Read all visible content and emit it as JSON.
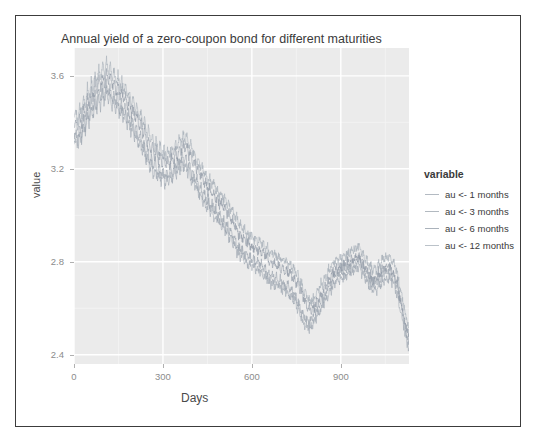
{
  "frame": {
    "border_color": "#3c3c3c",
    "background": "#ffffff"
  },
  "panel": {
    "background": "#ebebeb",
    "gridline_color": "#ffffff"
  },
  "chart_data": {
    "type": "line",
    "title": "Annual yield of a zero-coupon bond for different maturities",
    "xlabel": "Days",
    "ylabel": "value",
    "legend_title": "variable",
    "legend_position": "right",
    "grid": true,
    "xlim": [
      0,
      1130
    ],
    "ylim": [
      2.36,
      3.72
    ],
    "xticks": [
      0,
      300,
      600,
      900
    ],
    "yticks": [
      3.6,
      3.2,
      2.8,
      2.4
    ],
    "xtick_labels": [
      "0",
      "300",
      "600",
      "900"
    ],
    "ytick_labels": [
      "3.6",
      "3.2",
      "2.8",
      "2.4"
    ],
    "minor_xticks": [
      150,
      450,
      750,
      1050
    ],
    "minor_yticks": [
      3.4,
      3.0,
      2.6
    ],
    "series": [
      {
        "name": "au <- 1 months",
        "color": "#9aa3ad",
        "offset": -0.07,
        "values": [
          3.3,
          3.33,
          3.28,
          3.36,
          3.31,
          3.4,
          3.34,
          3.44,
          3.38,
          3.47,
          3.41,
          3.5,
          3.44,
          3.52,
          3.46,
          3.54,
          3.47,
          3.55,
          3.48,
          3.53,
          3.46,
          3.51,
          3.44,
          3.49,
          3.42,
          3.47,
          3.4,
          3.45,
          3.38,
          3.42,
          3.35,
          3.39,
          3.32,
          3.36,
          3.29,
          3.33,
          3.26,
          3.3,
          3.22,
          3.26,
          3.19,
          3.23,
          3.16,
          3.21,
          3.14,
          3.19,
          3.13,
          3.18,
          3.12,
          3.17,
          3.13,
          3.18,
          3.14,
          3.2,
          3.16,
          3.22,
          3.18,
          3.24,
          3.19,
          3.23,
          3.17,
          3.2,
          3.14,
          3.16,
          3.11,
          3.13,
          3.08,
          3.1,
          3.05,
          3.07,
          3.02,
          3.05,
          3.0,
          3.03,
          2.98,
          3.0,
          2.96,
          2.98,
          2.94,
          2.96,
          2.92,
          2.94,
          2.89,
          2.91,
          2.86,
          2.88,
          2.83,
          2.85,
          2.81,
          2.83,
          2.79,
          2.81,
          2.78,
          2.8,
          2.77,
          2.79,
          2.76,
          2.78,
          2.75,
          2.77,
          2.73,
          2.75,
          2.71,
          2.73,
          2.7,
          2.72,
          2.69,
          2.71,
          2.68,
          2.7,
          2.67,
          2.69,
          2.66,
          2.68,
          2.64,
          2.66,
          2.62,
          2.64,
          2.58,
          2.6,
          2.54,
          2.56,
          2.51,
          2.53,
          2.5,
          2.53,
          2.52,
          2.56,
          2.55,
          2.59,
          2.58,
          2.62,
          2.61,
          2.65,
          2.64,
          2.68,
          2.67,
          2.71,
          2.7,
          2.73,
          2.71,
          2.74,
          2.72,
          2.75,
          2.73,
          2.76,
          2.74,
          2.77,
          2.75,
          2.78,
          2.76,
          2.79,
          2.74,
          2.76,
          2.71,
          2.73,
          2.68,
          2.7,
          2.66,
          2.69,
          2.67,
          2.71,
          2.69,
          2.73,
          2.71,
          2.74,
          2.72,
          2.75,
          2.7,
          2.72,
          2.66,
          2.67,
          2.6,
          2.58,
          2.53,
          2.49,
          2.45,
          2.43
        ]
      },
      {
        "name": "au <- 3 months",
        "color": "#98a1ab",
        "offset": -0.02,
        "values": [
          3.33,
          3.36,
          3.31,
          3.39,
          3.34,
          3.43,
          3.37,
          3.47,
          3.41,
          3.5,
          3.44,
          3.53,
          3.47,
          3.55,
          3.49,
          3.57,
          3.5,
          3.58,
          3.51,
          3.56,
          3.49,
          3.54,
          3.47,
          3.52,
          3.45,
          3.5,
          3.43,
          3.48,
          3.41,
          3.45,
          3.38,
          3.42,
          3.35,
          3.39,
          3.32,
          3.36,
          3.29,
          3.33,
          3.25,
          3.29,
          3.22,
          3.26,
          3.19,
          3.24,
          3.17,
          3.22,
          3.16,
          3.21,
          3.15,
          3.2,
          3.16,
          3.21,
          3.17,
          3.23,
          3.19,
          3.25,
          3.21,
          3.27,
          3.22,
          3.26,
          3.2,
          3.23,
          3.17,
          3.19,
          3.14,
          3.16,
          3.11,
          3.13,
          3.08,
          3.1,
          3.05,
          3.08,
          3.03,
          3.06,
          3.01,
          3.03,
          2.99,
          3.01,
          2.97,
          2.99,
          2.95,
          2.97,
          2.92,
          2.94,
          2.89,
          2.91,
          2.86,
          2.88,
          2.84,
          2.86,
          2.82,
          2.84,
          2.81,
          2.83,
          2.8,
          2.82,
          2.79,
          2.81,
          2.78,
          2.8,
          2.76,
          2.78,
          2.74,
          2.76,
          2.73,
          2.75,
          2.72,
          2.74,
          2.71,
          2.73,
          2.7,
          2.72,
          2.69,
          2.71,
          2.67,
          2.69,
          2.65,
          2.67,
          2.61,
          2.63,
          2.57,
          2.59,
          2.54,
          2.56,
          2.53,
          2.56,
          2.55,
          2.59,
          2.58,
          2.62,
          2.61,
          2.65,
          2.64,
          2.68,
          2.67,
          2.71,
          2.7,
          2.74,
          2.73,
          2.76,
          2.74,
          2.77,
          2.75,
          2.78,
          2.76,
          2.79,
          2.77,
          2.8,
          2.78,
          2.81,
          2.79,
          2.82,
          2.77,
          2.79,
          2.74,
          2.76,
          2.71,
          2.73,
          2.69,
          2.72,
          2.7,
          2.74,
          2.72,
          2.76,
          2.74,
          2.77,
          2.75,
          2.78,
          2.73,
          2.75,
          2.69,
          2.7,
          2.63,
          2.61,
          2.56,
          2.52,
          2.48,
          2.46
        ]
      },
      {
        "name": "au <- 6 months",
        "color": "#8e98a4",
        "offset": 0.03,
        "values": [
          3.38,
          3.41,
          3.36,
          3.44,
          3.39,
          3.48,
          3.42,
          3.52,
          3.46,
          3.55,
          3.49,
          3.58,
          3.52,
          3.6,
          3.54,
          3.62,
          3.55,
          3.63,
          3.56,
          3.61,
          3.54,
          3.59,
          3.52,
          3.57,
          3.5,
          3.55,
          3.48,
          3.53,
          3.46,
          3.5,
          3.43,
          3.47,
          3.4,
          3.44,
          3.37,
          3.41,
          3.34,
          3.38,
          3.3,
          3.34,
          3.27,
          3.31,
          3.24,
          3.29,
          3.22,
          3.27,
          3.21,
          3.26,
          3.2,
          3.25,
          3.21,
          3.26,
          3.22,
          3.28,
          3.24,
          3.3,
          3.26,
          3.32,
          3.27,
          3.31,
          3.25,
          3.28,
          3.22,
          3.24,
          3.19,
          3.21,
          3.16,
          3.18,
          3.13,
          3.15,
          3.1,
          3.13,
          3.08,
          3.11,
          3.06,
          3.08,
          3.04,
          3.06,
          3.02,
          3.04,
          3.0,
          3.02,
          2.97,
          2.99,
          2.94,
          2.96,
          2.91,
          2.93,
          2.89,
          2.91,
          2.87,
          2.89,
          2.86,
          2.88,
          2.85,
          2.87,
          2.84,
          2.86,
          2.83,
          2.85,
          2.81,
          2.83,
          2.79,
          2.81,
          2.78,
          2.8,
          2.77,
          2.79,
          2.76,
          2.78,
          2.75,
          2.77,
          2.74,
          2.76,
          2.72,
          2.74,
          2.7,
          2.72,
          2.66,
          2.68,
          2.62,
          2.64,
          2.59,
          2.61,
          2.58,
          2.61,
          2.6,
          2.64,
          2.63,
          2.67,
          2.66,
          2.7,
          2.69,
          2.73,
          2.72,
          2.76,
          2.75,
          2.78,
          2.76,
          2.79,
          2.77,
          2.8,
          2.78,
          2.81,
          2.79,
          2.82,
          2.8,
          2.83,
          2.81,
          2.84,
          2.79,
          2.81,
          2.76,
          2.78,
          2.73,
          2.75,
          2.71,
          2.74,
          2.72,
          2.76,
          2.74,
          2.78,
          2.76,
          2.79,
          2.77,
          2.8,
          2.75,
          2.77,
          2.71,
          2.72,
          2.65,
          2.63,
          2.58,
          2.54,
          2.5,
          2.48
        ]
      },
      {
        "name": "au <- 12 months",
        "color": "#a4adb7",
        "offset": 0.08,
        "values": [
          3.42,
          3.45,
          3.4,
          3.48,
          3.43,
          3.52,
          3.46,
          3.56,
          3.5,
          3.59,
          3.53,
          3.62,
          3.56,
          3.64,
          3.58,
          3.66,
          3.59,
          3.67,
          3.6,
          3.65,
          3.58,
          3.63,
          3.56,
          3.61,
          3.54,
          3.59,
          3.52,
          3.57,
          3.5,
          3.54,
          3.47,
          3.51,
          3.44,
          3.48,
          3.41,
          3.45,
          3.38,
          3.42,
          3.34,
          3.38,
          3.31,
          3.35,
          3.28,
          3.33,
          3.26,
          3.31,
          3.25,
          3.3,
          3.24,
          3.29,
          3.25,
          3.3,
          3.26,
          3.32,
          3.28,
          3.34,
          3.3,
          3.36,
          3.31,
          3.35,
          3.29,
          3.32,
          3.26,
          3.28,
          3.23,
          3.25,
          3.2,
          3.22,
          3.17,
          3.19,
          3.14,
          3.17,
          3.12,
          3.15,
          3.1,
          3.12,
          3.08,
          3.1,
          3.06,
          3.08,
          3.04,
          3.06,
          3.01,
          3.03,
          2.98,
          3.0,
          2.95,
          2.97,
          2.93,
          2.95,
          2.91,
          2.93,
          2.9,
          2.92,
          2.89,
          2.91,
          2.88,
          2.9,
          2.87,
          2.89,
          2.85,
          2.87,
          2.83,
          2.85,
          2.82,
          2.84,
          2.81,
          2.83,
          2.8,
          2.82,
          2.79,
          2.81,
          2.78,
          2.8,
          2.76,
          2.78,
          2.74,
          2.76,
          2.7,
          2.72,
          2.66,
          2.68,
          2.63,
          2.65,
          2.62,
          2.65,
          2.64,
          2.68,
          2.67,
          2.71,
          2.7,
          2.74,
          2.73,
          2.77,
          2.76,
          2.8,
          2.79,
          2.82,
          2.8,
          2.83,
          2.81,
          2.84,
          2.82,
          2.85,
          2.83,
          2.86,
          2.84,
          2.87,
          2.85,
          2.88,
          2.83,
          2.85,
          2.8,
          2.82,
          2.77,
          2.79,
          2.75,
          2.78,
          2.76,
          2.8,
          2.78,
          2.82,
          2.8,
          2.83,
          2.81,
          2.84,
          2.79,
          2.81,
          2.75,
          2.76,
          2.69,
          2.67,
          2.62,
          2.58,
          2.54,
          2.52
        ]
      }
    ]
  }
}
